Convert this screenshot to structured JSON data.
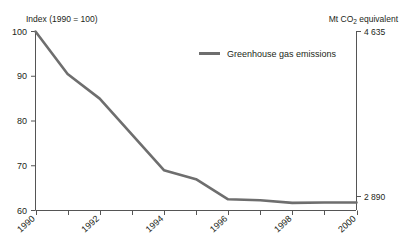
{
  "chart_data": {
    "type": "line",
    "title": "",
    "subtitle": "",
    "ylabel": "Index (1990 = 100)",
    "ylabel_right": "Mt CO2 equivalent",
    "xlabel": "",
    "x": [
      1990,
      1991,
      1992,
      1993,
      1994,
      1995,
      1996,
      1997,
      1998,
      1999,
      2000
    ],
    "series": [
      {
        "name": "Greenhouse gas emissions",
        "values": [
          100,
          90.5,
          85,
          77,
          69,
          67,
          62.5,
          62.3,
          61.7,
          61.8,
          61.8
        ],
        "color": "#6e6e6e"
      }
    ],
    "ylim": [
      60,
      100
    ],
    "yticks": [
      60,
      70,
      80,
      90,
      100
    ],
    "ytick_labels": [
      "60",
      "70",
      "80",
      "90",
      "100"
    ],
    "xticks": [
      1990,
      1991,
      1992,
      1993,
      1994,
      1995,
      1996,
      1997,
      1998,
      1999,
      2000
    ],
    "xtick_labels_shown": [
      "1990",
      "1992",
      "1994",
      "1996",
      "1998",
      "2000"
    ],
    "right_axis_top_label": "4 635",
    "right_axis_bottom_label": "2 890",
    "grid": false,
    "legend_position": "top-center"
  },
  "axes": {
    "left_title": "Index (1990 = 100)",
    "right_title_prefix": "Mt CO",
    "right_title_sub": "2",
    "right_title_suffix": " equivalent",
    "y_tick_labels": [
      "100",
      "90",
      "80",
      "70",
      "60"
    ],
    "x_tick_labels": [
      "1990",
      "1992",
      "1994",
      "1996",
      "1998",
      "2000"
    ],
    "right_top_value": "4 635",
    "right_bottom_value": "2 890"
  },
  "legend": {
    "items": [
      {
        "label": "Greenhouse gas emissions",
        "color": "#6e6e6e"
      }
    ]
  },
  "colors": {
    "line": "#6e6e6e",
    "axis": "#555555",
    "text": "#231f20",
    "background": "#ffffff"
  }
}
